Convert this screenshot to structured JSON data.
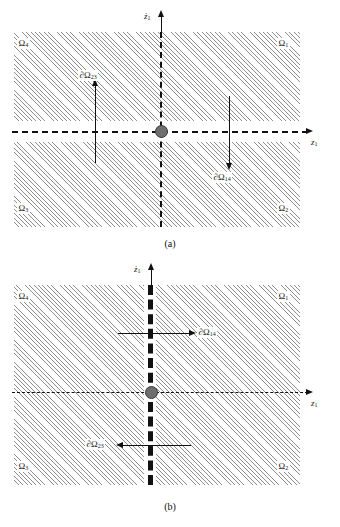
{
  "figure": {
    "type": "phase-plane-switching-diagram",
    "panels": [
      {
        "id": "a",
        "caption": "(a)",
        "axis_vertical": "ż",
        "axis_vertical_sub": "1",
        "axis_horizontal": "z",
        "axis_horizontal_sub": "1",
        "switching_surface_orientation": "horizontal",
        "regions": [
          {
            "name": "region-top-left",
            "label": "Ω",
            "sub": "4"
          },
          {
            "name": "region-top-right",
            "label": "Ω",
            "sub": "1"
          },
          {
            "name": "region-bottom-left",
            "label": "Ω",
            "sub": "3"
          },
          {
            "name": "region-bottom-right",
            "label": "Ω",
            "sub": "2"
          }
        ],
        "boundaries": [
          {
            "name": "boundary-upward",
            "label": "∂Ω",
            "sub": "23",
            "direction": "up"
          },
          {
            "name": "boundary-downward",
            "label": "∂Ω",
            "sub": "14",
            "direction": "down"
          }
        ]
      },
      {
        "id": "b",
        "caption": "(b)",
        "axis_vertical": "ż",
        "axis_vertical_sub": "1",
        "axis_horizontal": "z",
        "axis_horizontal_sub": "1",
        "switching_surface_orientation": "vertical",
        "regions": [
          {
            "name": "region-top-left",
            "label": "Ω",
            "sub": "4"
          },
          {
            "name": "region-top-right",
            "label": "Ω",
            "sub": "1"
          },
          {
            "name": "region-bottom-left",
            "label": "Ω",
            "sub": "3"
          },
          {
            "name": "region-bottom-right",
            "label": "Ω",
            "sub": "2"
          }
        ],
        "boundaries": [
          {
            "name": "boundary-rightward",
            "label": "∂Ω",
            "sub": "14",
            "direction": "right"
          },
          {
            "name": "boundary-leftward",
            "label": "∂Ω",
            "sub": "23",
            "direction": "left"
          }
        ]
      }
    ],
    "colors": {
      "hatch": "#8d8d8d",
      "line": "#111111",
      "origin_dot": "#6e6e6e",
      "background": "#ffffff"
    }
  }
}
